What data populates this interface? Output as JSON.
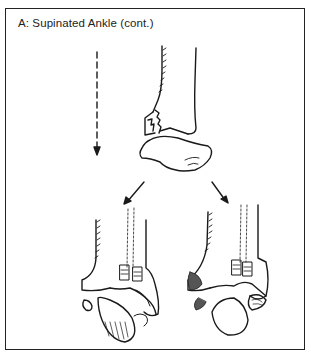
{
  "figure": {
    "caption": "A: Supinated Ankle (cont.)",
    "illustration": {
      "subject": "ankle-fracture-diagram",
      "elements": [
        "force-arrow-dashed-down",
        "tibia-with-medial-malleolus-fracture",
        "talus",
        "branch-arrow-left",
        "branch-arrow-right",
        "ankle-outcome-left",
        "ankle-outcome-right"
      ]
    },
    "colors": {
      "line": "#1a1a1a",
      "background": "#ffffff",
      "border": "#222222"
    }
  }
}
